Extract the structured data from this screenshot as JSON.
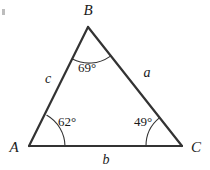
{
  "figure": {
    "type": "geometry-diagram",
    "shape": "triangle",
    "background_color": "#ffffff",
    "line_color": "#333333",
    "text_color": "#1a1a1a"
  },
  "vertices": [
    {
      "name": "A",
      "label": "A",
      "x": 29,
      "y": 146,
      "label_x": 14,
      "label_y": 152
    },
    {
      "name": "B",
      "label": "B",
      "x": 88,
      "y": 27,
      "label_x": 88,
      "label_y": 15
    },
    {
      "name": "C",
      "label": "C",
      "x": 182,
      "y": 146,
      "label_x": 196,
      "label_y": 152
    }
  ],
  "sides": [
    {
      "name": "a",
      "label": "a",
      "between": "B-C",
      "label_x": 147,
      "label_y": 77
    },
    {
      "name": "b",
      "label": "b",
      "between": "A-C",
      "label_x": 106,
      "label_y": 164
    },
    {
      "name": "c",
      "label": "c",
      "between": "A-B",
      "label_x": 48,
      "label_y": 83
    }
  ],
  "angles": [
    {
      "at": "A",
      "label": "62°",
      "value": 62,
      "unit": "degrees",
      "label_x": 67,
      "label_y": 126
    },
    {
      "at": "B",
      "label": "69°",
      "value": 69,
      "unit": "degrees",
      "label_x": 87,
      "label_y": 72
    },
    {
      "at": "C",
      "label": "49°",
      "value": 49,
      "unit": "degrees",
      "label_x": 143,
      "label_y": 126
    }
  ],
  "angle_sum": 180
}
